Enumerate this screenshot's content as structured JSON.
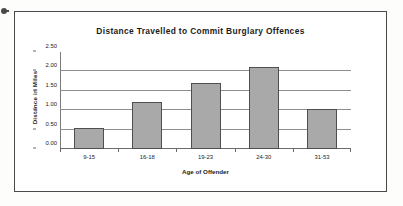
{
  "figure": {
    "frame_border_color": "#4a4a4a",
    "background": "#ffffff"
  },
  "artifact": {
    "name": "scan-speck"
  },
  "chart_data": {
    "type": "bar",
    "title": "Distance Travelled to Commit Burglary Offences",
    "xlabel": "Age of Offender",
    "ylabel": "Distance in Miles",
    "categories": [
      "9-15",
      "16-18",
      "19-23",
      "24-30",
      "31-53"
    ],
    "values": [
      0.53,
      1.22,
      1.7,
      2.12,
      1.02
    ],
    "ylim": [
      0.0,
      2.5
    ],
    "ytick_labels": [
      "0.00",
      "0.50",
      "1.00",
      "1.50",
      "2.00",
      "2.50"
    ],
    "ytick_values": [
      0.0,
      0.5,
      1.0,
      1.5,
      2.0,
      2.5
    ],
    "grid": true,
    "grid_axis": "y",
    "legend": false,
    "bar_fill": "#a9a9a9",
    "bar_border": "#4f4f4f",
    "gridline_color": "#8e8e8e"
  }
}
